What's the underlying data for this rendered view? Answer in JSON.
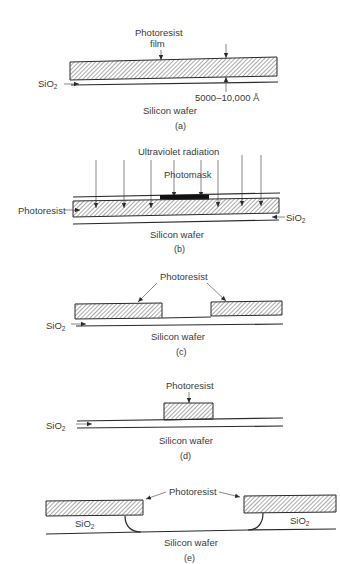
{
  "figure": {
    "panels": [
      {
        "id": "a",
        "caption": "(a)",
        "labels": {
          "photoresist": "Photoresist",
          "film": "film",
          "sio2_base": "SiO",
          "sio2_sub": "2",
          "thickness": "5000–10,000 Å",
          "wafer": "Silicon wafer"
        }
      },
      {
        "id": "b",
        "caption": "(b)",
        "labels": {
          "uv": "Ultraviolet radiation",
          "photomask": "Photomask",
          "photoresist": "Photoresist",
          "sio2_base": "SiO",
          "sio2_sub": "2",
          "wafer": "Silicon wafer"
        }
      },
      {
        "id": "c",
        "caption": "(c)",
        "labels": {
          "photoresist": "Photoresist",
          "sio2_base": "SiO",
          "sio2_sub": "2",
          "wafer": "Silicon wafer"
        }
      },
      {
        "id": "d",
        "caption": "(d)",
        "labels": {
          "photoresist": "Photoresist",
          "sio2_base": "SiO",
          "sio2_sub": "2",
          "wafer": "Silicon wafer"
        }
      },
      {
        "id": "e",
        "caption": "(e)",
        "labels": {
          "photoresist": "Photoresist",
          "sio2_left_base": "SiO",
          "sio2_left_sub": "2",
          "sio2_right_base": "SiO",
          "sio2_right_sub": "2",
          "wafer": "Silicon wafer"
        }
      }
    ]
  },
  "colors": {
    "ink": "#2a2a2a",
    "text": "#3a3a3a",
    "background": "#ffffff",
    "mask": "#111111"
  }
}
